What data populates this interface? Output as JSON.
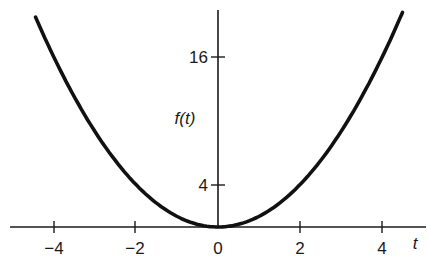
{
  "chart_data": {
    "type": "line",
    "title": "",
    "function": "f(t) = t^2",
    "xlabel": "t",
    "ylabel": "f(t)",
    "x_ticks": [
      -4,
      -2,
      0,
      2,
      4
    ],
    "x_tick_labels": [
      "−4",
      "−2",
      "0",
      "2",
      "4"
    ],
    "y_ticks": [
      4,
      16
    ],
    "y_tick_labels": [
      "4",
      "16"
    ],
    "xlim": [
      -5.2,
      5.0
    ],
    "ylim": [
      0,
      20.5
    ],
    "grid": false,
    "legend": null,
    "series": [
      {
        "name": "f(t)",
        "x": [
          -4.45,
          -4,
          -3,
          -2,
          -1,
          0,
          1,
          2,
          3,
          4,
          4.5
        ],
        "values": [
          19.8,
          16,
          9,
          4,
          1,
          0,
          1,
          4,
          9,
          16,
          20.25
        ]
      }
    ]
  },
  "labels": {
    "x_axis": "t",
    "y_axis": "f(t)",
    "xt0": "−4",
    "xt1": "−2",
    "xt2": "0",
    "xt3": "2",
    "xt4": "4",
    "yt0": "4",
    "yt1": "16"
  }
}
